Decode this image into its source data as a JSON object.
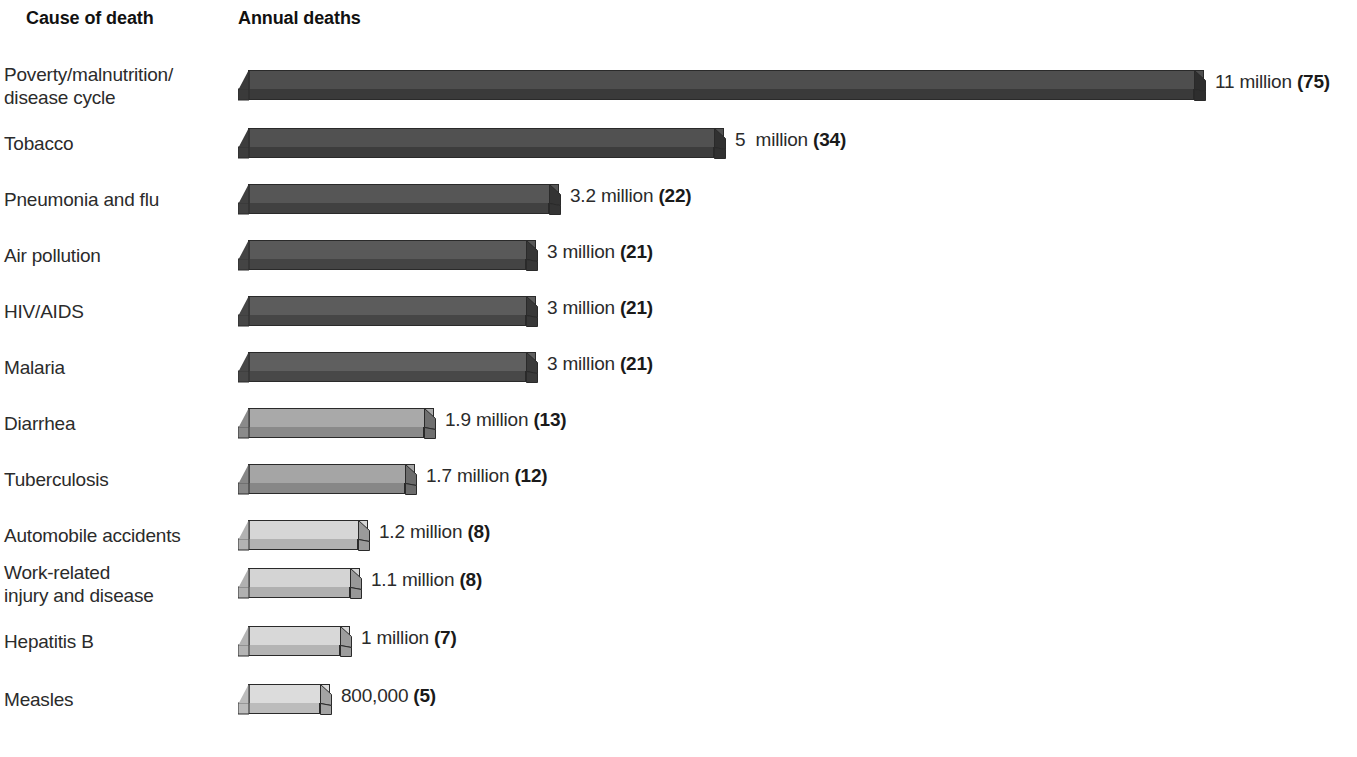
{
  "header": {
    "cause_label": "Cause of death",
    "deaths_label": "Annual deaths"
  },
  "chart_data": {
    "type": "bar",
    "orientation": "horizontal",
    "title": "",
    "xlabel": "Annual deaths",
    "ylabel": "Cause of death",
    "grid": false,
    "legend": "none",
    "value_unit": "deaths per year",
    "percent_note": "Bold parenthetical number is annual deaths in hundred-thousands (e.g. 75 = 7.5 million scale marker shown in source)",
    "categories": [
      "Poverty/malnutrition/\ndisease cycle",
      "Tobacco",
      "Pneumonia and flu",
      "Air pollution",
      "HIV/AIDS",
      "Malaria",
      "Diarrhea",
      "Tuberculosis",
      "Automobile accidents",
      "Work-related\ninjury and disease",
      "Hepatitis B",
      "Measles"
    ],
    "values": [
      11000000,
      5000000,
      3200000,
      3000000,
      3000000,
      3000000,
      1900000,
      1700000,
      1200000,
      1100000,
      1000000,
      800000
    ],
    "value_labels": [
      "11 million ",
      "5  million ",
      "3.2 million ",
      "3 million ",
      "3 million ",
      "3 million ",
      "1.9 million ",
      "1.7 million ",
      "1.2 million ",
      "1.1 million ",
      "1 million ",
      "800,000 "
    ],
    "bold_labels": [
      "(75)",
      "(34)",
      "(22)",
      "(21)",
      "(21)",
      "(21)",
      "(13)",
      "(12)",
      "(8)",
      "(8)",
      "(7)",
      "(5)"
    ],
    "xlim": [
      0,
      11000000
    ]
  },
  "rows": [
    {
      "label": "Poverty/malnutrition/\ndisease cycle",
      "two_line": true,
      "value_text": "11 million ",
      "value_bold": "(75)",
      "bar_px": 956,
      "top_color": "#4e4e4e",
      "front_color": "#3a3a3a",
      "cap_color": "#2e2e2e"
    },
    {
      "label": "Tobacco",
      "two_line": false,
      "value_text": "5  million ",
      "value_bold": "(34)",
      "bar_px": 476,
      "top_color": "#515151",
      "front_color": "#3d3d3d",
      "cap_color": "#313131"
    },
    {
      "label": "Pneumonia and flu",
      "two_line": false,
      "value_text": "3.2 million ",
      "value_bold": "(22)",
      "bar_px": 311,
      "top_color": "#565656",
      "front_color": "#414141",
      "cap_color": "#343434"
    },
    {
      "label": "Air pollution",
      "two_line": false,
      "value_text": "3 million ",
      "value_bold": "(21)",
      "bar_px": 288,
      "top_color": "#595959",
      "front_color": "#444444",
      "cap_color": "#363636"
    },
    {
      "label": "HIV/AIDS",
      "two_line": false,
      "value_text": "3 million ",
      "value_bold": "(21)",
      "bar_px": 288,
      "top_color": "#5c5c5c",
      "front_color": "#464646",
      "cap_color": "#383838"
    },
    {
      "label": "Malaria",
      "two_line": false,
      "value_text": "3 million ",
      "value_bold": "(21)",
      "bar_px": 288,
      "top_color": "#5f5f5f",
      "front_color": "#484848",
      "cap_color": "#3a3a3a"
    },
    {
      "label": "Diarrhea",
      "two_line": false,
      "value_text": "1.9 million ",
      "value_bold": "(13)",
      "bar_px": 186,
      "top_color": "#a9a9a9",
      "front_color": "#8a8a8a",
      "cap_color": "#6f6f6f"
    },
    {
      "label": "Tuberculosis",
      "two_line": false,
      "value_text": "1.7 million ",
      "value_bold": "(12)",
      "bar_px": 167,
      "top_color": "#a5a5a5",
      "front_color": "#878787",
      "cap_color": "#6c6c6c"
    },
    {
      "label": "Automobile accidents",
      "two_line": false,
      "value_text": "1.2 million ",
      "value_bold": "(8)",
      "bar_px": 120,
      "top_color": "#d6d6d6",
      "front_color": "#b2b2b2",
      "cap_color": "#9a9a9a"
    },
    {
      "label": "Work-related\ninjury and disease",
      "two_line": true,
      "value_text": "1.1 million ",
      "value_bold": "(8)",
      "bar_px": 112,
      "top_color": "#d4d4d4",
      "front_color": "#b0b0b0",
      "cap_color": "#989898"
    },
    {
      "label": "Hepatitis B",
      "two_line": false,
      "value_text": "1 million ",
      "value_bold": "(7)",
      "bar_px": 102,
      "top_color": "#d8d8d8",
      "front_color": "#b4b4b4",
      "cap_color": "#9c9c9c"
    },
    {
      "label": "Measles",
      "two_line": false,
      "value_text": "800,000 ",
      "value_bold": "(5)",
      "bar_px": 82,
      "top_color": "#dcdcdc",
      "front_color": "#bcbcbc",
      "cap_color": "#a4a4a4"
    }
  ],
  "layout": {
    "row_tops": [
      62,
      120,
      176,
      232,
      288,
      344,
      400,
      456,
      512,
      560,
      618,
      676
    ],
    "bar_left": 238,
    "label_gap": 10
  }
}
